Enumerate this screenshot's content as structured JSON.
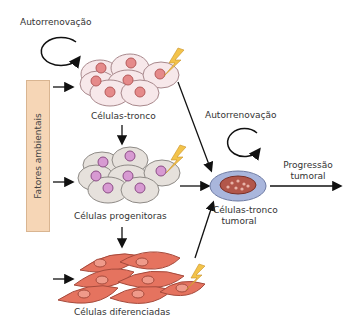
{
  "diagram": {
    "labels": {
      "self_renewal_top": "Autorrenovação",
      "self_renewal_right": "Autorrenovação",
      "stem_cells": "Células-tronco",
      "progenitor_cells": "Células progenitoras",
      "differentiated_cells": "Células diferenciadas",
      "tumor_stem_cells_line1": "Células-tronco",
      "tumor_stem_cells_line2": "tumoral",
      "tumor_progression_line1": "Progressão",
      "tumor_progression_line2": "tumoral",
      "environmental_factors": "Fatores ambientais"
    },
    "colors": {
      "factors_box": "#f6d6b6",
      "stem_cell_fill": "#f7e8ea",
      "stem_nucleus": "#e58a8a",
      "progenitor_fill": "#e6e1dc",
      "progenitor_nucleus": "#d79ad2",
      "differentiated_fill": "#e5735f",
      "tumor_outer": "#a9b6dc",
      "tumor_inner": "#b2564a",
      "lightning": "#f3c34a"
    }
  }
}
